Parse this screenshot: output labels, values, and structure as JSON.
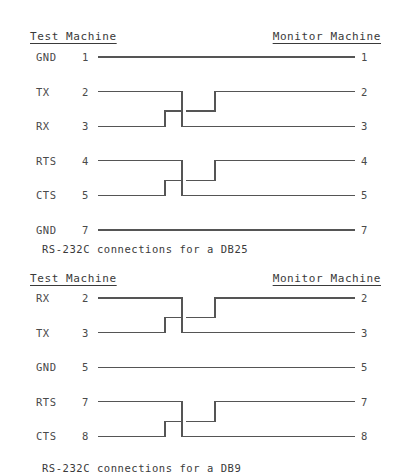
{
  "diagrams": [
    {
      "id": "db25",
      "caption": "RS-232C connections for a DB25",
      "header_left": "Test Machine",
      "header_right": "Monitor Machine",
      "rows": [
        {
          "signal": "GND",
          "pin_left": "1",
          "pin_right": "1",
          "link": "straight"
        },
        {
          "signal": "TX",
          "pin_left": "2",
          "pin_right": "2",
          "link": "cross-top"
        },
        {
          "signal": "RX",
          "pin_left": "3",
          "pin_right": "3",
          "link": "cross-bottom"
        },
        {
          "signal": "RTS",
          "pin_left": "4",
          "pin_right": "4",
          "link": "cross-top"
        },
        {
          "signal": "CTS",
          "pin_left": "5",
          "pin_right": "5",
          "link": "cross-bottom"
        },
        {
          "signal": "GND",
          "pin_left": "7",
          "pin_right": "7",
          "link": "straight"
        }
      ]
    },
    {
      "id": "db9",
      "caption": "RS-232C connections for a DB9",
      "header_left": "Test Machine",
      "header_right": "Monitor Machine",
      "rows": [
        {
          "signal": "RX",
          "pin_left": "2",
          "pin_right": "2",
          "link": "cross-top"
        },
        {
          "signal": "TX",
          "pin_left": "3",
          "pin_right": "3",
          "link": "cross-bottom"
        },
        {
          "signal": "GND",
          "pin_left": "5",
          "pin_right": "5",
          "link": "straight"
        },
        {
          "signal": "RTS",
          "pin_left": "7",
          "pin_right": "7",
          "link": "cross-top"
        },
        {
          "signal": "CTS",
          "pin_left": "8",
          "pin_right": "8",
          "link": "cross-bottom"
        }
      ]
    }
  ],
  "colors": {
    "wire": "#555555",
    "text": "#3a3a3a",
    "background": "#ffffff"
  }
}
